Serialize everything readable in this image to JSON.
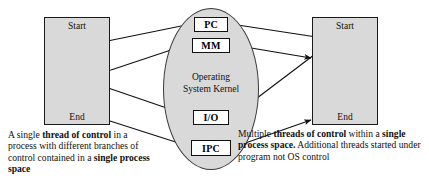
{
  "diagram": {
    "colors": {
      "process_fill": "#d9d9d9",
      "kernel_fill": "#d9d9d9",
      "service_box_fill": "#ffffff",
      "stroke": "#111111",
      "background": "#ffffff"
    }
  },
  "kernel": {
    "title_line1": "Operating",
    "title_line2": "System Kernel",
    "services": [
      {
        "id": "pc",
        "label": "PC"
      },
      {
        "id": "mm",
        "label": "MM"
      },
      {
        "id": "io",
        "label": "I/O"
      },
      {
        "id": "ipc",
        "label": "IPC"
      }
    ]
  },
  "process_left": {
    "start_label": "Start",
    "end_label": "End",
    "thread_count": 1
  },
  "process_right": {
    "start_label": "Start",
    "end_label": "End",
    "thread_count": 3
  },
  "caption_left": {
    "seg1": "A single ",
    "bold1": "thread of control",
    "seg2": " in a process with different branches of control contained in a ",
    "bold2": "single process space"
  },
  "caption_right": {
    "seg1": "Multiple ",
    "bold1": "threads of control",
    "seg2": " within a ",
    "bold2": "single process space.",
    "seg3": " Additional threads started under program not OS control"
  }
}
